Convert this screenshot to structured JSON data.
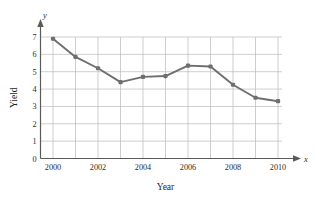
{
  "chart_data": {
    "type": "line",
    "title": "",
    "xlabel": "Year",
    "ylabel": "Yield",
    "x_axis_symbol": "x",
    "y_axis_symbol": "y",
    "x": [
      2000,
      2001,
      2002,
      2003,
      2004,
      2005,
      2006,
      2007,
      2008,
      2009,
      2010
    ],
    "values": [
      6.9,
      5.85,
      5.2,
      4.4,
      4.7,
      4.75,
      5.35,
      5.3,
      4.25,
      3.5,
      3.3
    ],
    "xlim": [
      1999.5,
      2010.5
    ],
    "ylim": [
      0,
      7
    ],
    "x_tick_labels": [
      "2000",
      "2002",
      "2004",
      "2006",
      "2008",
      "2010"
    ],
    "x_tick_values": [
      2000,
      2002,
      2004,
      2006,
      2008,
      2010
    ],
    "y_tick_labels": [
      "0",
      "1",
      "2",
      "3",
      "4",
      "5",
      "6",
      "7"
    ],
    "y_tick_values": [
      0,
      1,
      2,
      3,
      4,
      5,
      6,
      7
    ],
    "grid": true,
    "legend": "none",
    "series_color": "#6e6e6e",
    "grid_color": "#b9b9b9",
    "axis_color": "#5a5a5a"
  }
}
